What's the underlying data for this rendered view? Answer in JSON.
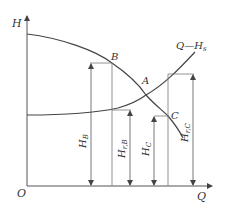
{
  "diagram": {
    "axes": {
      "y_label": "H",
      "x_label": "Q",
      "origin_label": "O"
    },
    "curves": {
      "pump_curve": "H",
      "system_curve_label": "Q—H",
      "system_curve_sub": "s"
    },
    "points": {
      "A": "A",
      "B": "B",
      "C": "C"
    },
    "dimensions": {
      "H_B": {
        "main": "H",
        "sub": "B"
      },
      "H_rB": {
        "main": "H",
        "sub": "r,B"
      },
      "H_C": {
        "main": "H",
        "sub": "C"
      },
      "H_rC": {
        "main": "H",
        "sub": "r,C"
      }
    },
    "colors": {
      "line": "#444444",
      "thin": "#777777",
      "text": "#333333"
    }
  }
}
